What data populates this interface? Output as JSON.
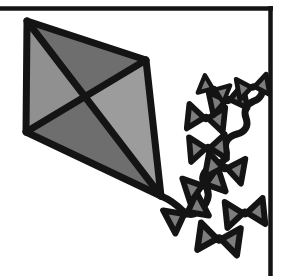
{
  "document": {
    "title": "Kite Clip Art",
    "type": "line-art-illustration",
    "subject": "kite-with-bow-tail",
    "background_color": "#ffffff",
    "alt_text": "Black and white clip art of a diamond kite with a long tail of bow ties"
  },
  "palette": {
    "outline": "#141414",
    "ink_black": "#1a1a1a",
    "gray_light": "#9a9a9a",
    "gray_medium": "#808080",
    "gray_dark": "#6b6b6b",
    "gray_darkest": "#5e5e5e",
    "bow_fill": "#7d7d7d",
    "paper_white": "#ffffff"
  },
  "frame": {
    "name": "border-rule",
    "top_rule": {
      "x1": 0,
      "y1": 8.5,
      "x2": 273,
      "y2": 8.5,
      "width": 4.5
    },
    "right_rule": {
      "x1": 270.5,
      "y1": 6,
      "x2": 270.5,
      "y2": 276,
      "width": 4.5
    },
    "color": "#141414"
  },
  "kite": {
    "name": "kite-body",
    "label": "Diamond kite",
    "points": {
      "apex_top": {
        "x": 27,
        "y": 21
      },
      "corner_right": {
        "x": 146,
        "y": 60
      },
      "tip_bottom": {
        "x": 161,
        "y": 196
      },
      "corner_left": {
        "x": 26,
        "y": 132
      },
      "center_cross": {
        "x": 84,
        "y": 98
      }
    },
    "outline_width": 7,
    "quadrants": [
      {
        "name": "panel-left",
        "fill": "#909090",
        "vertices": "27,21 84,98 26,132"
      },
      {
        "name": "panel-top",
        "fill": "#6e6e6e",
        "vertices": "27,21 146,60 84,98"
      },
      {
        "name": "panel-right",
        "fill": "#9c9c9c",
        "vertices": "146,60 161,196 84,98"
      },
      {
        "name": "panel-bottom",
        "fill": "#6e6e6e",
        "vertices": "84,98 161,196 26,132"
      }
    ],
    "spars": [
      {
        "name": "spar-vertical",
        "from": "apex_top",
        "to": "tip_bottom"
      },
      {
        "name": "spar-horizontal",
        "from": "corner_left",
        "to": "corner_right"
      }
    ]
  },
  "tail": {
    "name": "kite-tail",
    "label": "Bow-tie tail",
    "string_width": 7,
    "string_color": "#141414",
    "string_path": "M161,196 C171,200 178,206 184,212 C190,217 198,214 204,206 C210,198 209,190 204,183 C200,176 206,168 214,166 C222,164 228,158 226,150 C224,142 229,136 237,134 C245,132 249,126 246,118 C243,110 247,104 254,101 C260,99 263,94 262,88",
    "bow_count": 10,
    "bows": [
      {
        "name": "bow-1",
        "cx": 186,
        "cy": 213,
        "angle": -28,
        "scale": 1.0
      },
      {
        "name": "bow-2",
        "cx": 219,
        "cy": 239,
        "angle": 8,
        "scale": 1.05
      },
      {
        "name": "bow-3",
        "cx": 204,
        "cy": 185,
        "angle": -18,
        "scale": 0.98
      },
      {
        "name": "bow-4",
        "cx": 245,
        "cy": 213,
        "angle": -6,
        "scale": 1.0
      },
      {
        "name": "bow-5",
        "cx": 225,
        "cy": 168,
        "angle": 10,
        "scale": 0.97
      },
      {
        "name": "bow-6",
        "cx": 208,
        "cy": 148,
        "angle": -5,
        "scale": 0.95
      },
      {
        "name": "bow-7",
        "cx": 206,
        "cy": 118,
        "angle": 6,
        "scale": 0.95
      },
      {
        "name": "bow-8",
        "cx": 228,
        "cy": 100,
        "angle": -12,
        "scale": 0.92
      },
      {
        "name": "bow-9",
        "cx": 214,
        "cy": 89,
        "angle": 22,
        "scale": 0.72
      },
      {
        "name": "bow-10",
        "cx": 253,
        "cy": 87,
        "angle": -10,
        "scale": 0.8
      }
    ],
    "bow_shape": {
      "left_wing": "-19,-13 -2,0 -19,13",
      "right_wing": "19,-13 2,0 19,13",
      "knot_radius": 4.5,
      "fill": "#7d7d7d",
      "stroke": "#141414",
      "stroke_width": 6
    }
  }
}
